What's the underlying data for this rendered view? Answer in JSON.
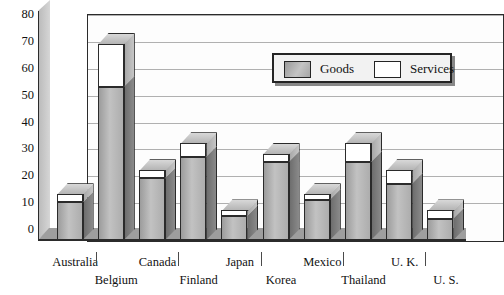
{
  "chart_data": {
    "type": "bar",
    "subtype": "stacked-3d-column",
    "title": "",
    "xlabel": "",
    "ylabel": "",
    "ylim": [
      0,
      80
    ],
    "yticks": [
      0,
      10,
      20,
      30,
      40,
      50,
      60,
      70,
      80
    ],
    "grid": true,
    "legend_position": "inside-top-right",
    "categories": [
      "Australia",
      "Belgium",
      "Canada",
      "Finland",
      "Japan",
      "Korea",
      "Mexico",
      "Thailand",
      "U. K.",
      "U. S."
    ],
    "series": [
      {
        "name": "Goods",
        "color": "#b4b4b4",
        "values": [
          14,
          57,
          23,
          31,
          9,
          29,
          15,
          29,
          21,
          8
        ]
      },
      {
        "name": "Services",
        "color": "#ffffff",
        "values": [
          3,
          16,
          3,
          5,
          2,
          3,
          2,
          7,
          5,
          3
        ]
      }
    ],
    "totals": [
      17,
      73,
      26,
      36,
      11,
      32,
      17,
      36,
      26,
      11
    ]
  },
  "axis": {
    "y_tick_labels": [
      "80",
      "70",
      "60",
      "50",
      "40",
      "30",
      "20",
      "10",
      "0"
    ]
  },
  "legend": {
    "items": [
      {
        "label": "Goods",
        "swatch": "goods-swatch"
      },
      {
        "label": "Services",
        "swatch": "services-swatch"
      }
    ]
  }
}
